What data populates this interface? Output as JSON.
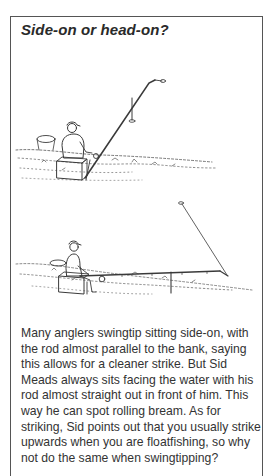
{
  "panel": {
    "title": "Side-on or head-on?",
    "illustrations": [
      {
        "id": "top",
        "description": "Angler seated side-on with rod angled up along the bank on a rest, swingtip at end"
      },
      {
        "id": "bottom",
        "description": "Angler seated facing the water with rod pointing straight out on a rest, swingtip hanging"
      }
    ],
    "body": "Many anglers swingtip sitting side-on, with the rod almost parallel to the bank, saying this allows for a cleaner strike. But Sid Meads always sits facing the water with his rod almost straight out in front of him. This way he can spot rolling bream. As for striking, Sid points out that you usually strike upwards when you are floatfishing, so why not do the same when swingtipping?"
  },
  "colors": {
    "border": "#555555",
    "text": "#333333",
    "ink": "#3a3a3a"
  }
}
